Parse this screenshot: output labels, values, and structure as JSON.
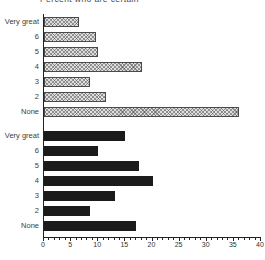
{
  "title_clipped": "Percent who are certain",
  "colors": {
    "solid_bar": "#1b1b1b",
    "hatch_fill": "#dedede",
    "hatch_line": "#505050",
    "bar_border": "#4a4a4a",
    "axis": "#222222",
    "label_text": "#3c3c3c"
  },
  "chart_data": {
    "type": "bar",
    "orientation": "horizontal",
    "categories": [
      "Very great",
      "6",
      "5",
      "4",
      "3",
      "2",
      "None"
    ],
    "series": [
      {
        "name": "top-group-hatched",
        "style": "hatched",
        "values": [
          6.5,
          9.5,
          10,
          18,
          8.5,
          11.5,
          36
        ]
      },
      {
        "name": "bottom-group-solid",
        "style": "solid",
        "values": [
          15,
          10,
          17.5,
          20,
          13,
          8.5,
          17
        ]
      }
    ],
    "xlabel": "",
    "ylabel": "",
    "xlim": [
      0,
      40
    ],
    "xticks": [
      0,
      5,
      10,
      15,
      20,
      25,
      30,
      35,
      40
    ],
    "minor_tick_step": 1,
    "grid": "off",
    "legend": "none"
  }
}
